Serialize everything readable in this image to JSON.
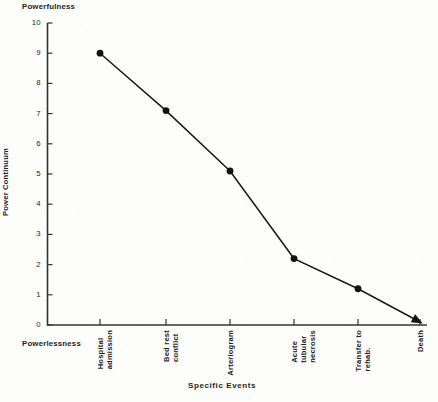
{
  "chart_data": {
    "type": "line",
    "title": "",
    "top_axis_annotation": "Powerfulness",
    "bottom_axis_annotation": "Powerlessness",
    "xlabel": "Specific Events",
    "ylabel": "Power Continuum",
    "ylim": [
      0,
      10
    ],
    "yticks": [
      0,
      1,
      2,
      3,
      4,
      5,
      6,
      7,
      8,
      9,
      10
    ],
    "ytick_labels": [
      "0",
      "1",
      "2",
      "3",
      "4",
      "5",
      "6",
      "7",
      "8",
      "9",
      "10"
    ],
    "grid": false,
    "legend": false,
    "marker": "filled-circle",
    "end_marker": "filled-arrowhead",
    "line_color": "#1a1a1a",
    "marker_color": "#111111",
    "axis_color": "#333333",
    "categories": [
      "Hospital admission",
      "Bed rest conflict",
      "Arteriogram",
      "Acute tubular necrosis",
      "Transfer to rehab.",
      "Death"
    ],
    "category_lines": [
      [
        "Hospital",
        "admission"
      ],
      [
        "Bed rest",
        "conflict"
      ],
      [
        "Arteriogram"
      ],
      [
        "Acute",
        "tubular",
        "necrosis"
      ],
      [
        "Transfer to",
        "rehab."
      ],
      [
        "Death"
      ]
    ],
    "values": [
      9.0,
      7.1,
      5.1,
      2.2,
      1.2,
      0.1
    ]
  }
}
